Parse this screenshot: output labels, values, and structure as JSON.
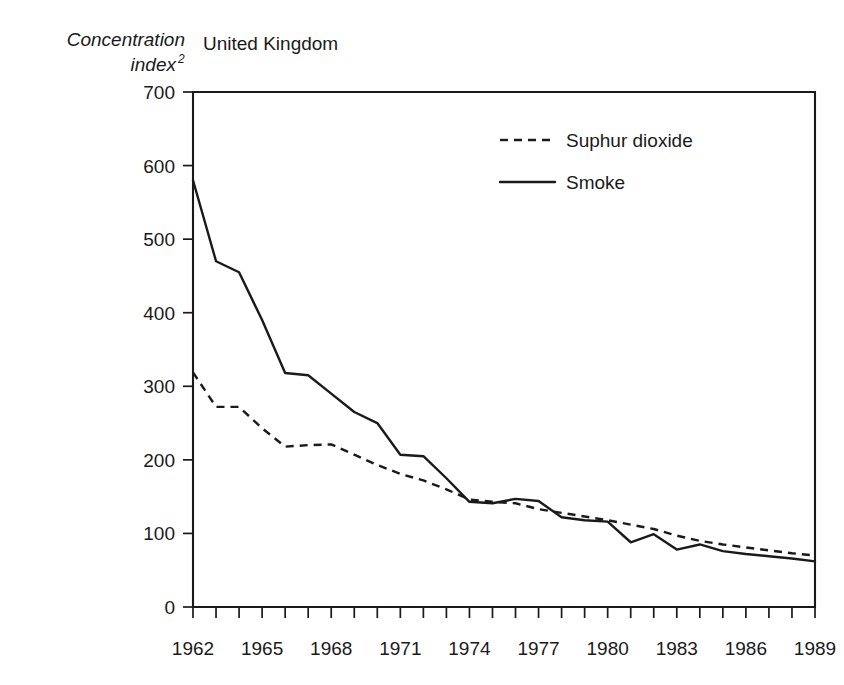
{
  "figure": {
    "panel_title": "United Kingdom",
    "y_axis_label_line1": "Concentration",
    "y_axis_label_line2": "index",
    "y_axis_label_superscript": "2"
  },
  "legend": {
    "position": "top-center-right",
    "entries": [
      {
        "label": "Suphur dioxide",
        "style": "dashed",
        "color": "#1a1a1a"
      },
      {
        "label": "Smoke",
        "style": "solid",
        "color": "#1a1a1a"
      }
    ]
  },
  "chart_data": {
    "type": "line",
    "title": "United Kingdom",
    "xlabel": "",
    "ylabel": "Concentration index2",
    "xlim": [
      1962,
      1989
    ],
    "ylim": [
      0,
      700
    ],
    "grid": false,
    "legend_position": "upper center",
    "x": [
      1962,
      1963,
      1964,
      1965,
      1966,
      1967,
      1968,
      1969,
      1970,
      1971,
      1972,
      1973,
      1974,
      1975,
      1976,
      1977,
      1978,
      1979,
      1980,
      1981,
      1982,
      1983,
      1984,
      1985,
      1986,
      1987,
      1988,
      1989
    ],
    "x_tick_labels": [
      "1962",
      "1965",
      "1968",
      "1971",
      "1974",
      "1977",
      "1980",
      "1983",
      "1986",
      "1989"
    ],
    "x_tick_values": [
      1962,
      1965,
      1968,
      1971,
      1974,
      1977,
      1980,
      1983,
      1986,
      1989
    ],
    "x_minor_ticks_every": 1,
    "y_tick_labels": [
      "0",
      "100",
      "200",
      "300",
      "400",
      "500",
      "600",
      "700"
    ],
    "y_tick_values": [
      0,
      100,
      200,
      300,
      400,
      500,
      600,
      700
    ],
    "series": [
      {
        "name": "Suphur dioxide",
        "style": "dashed",
        "color": "#1a1a1a",
        "values": [
          319,
          272,
          272,
          243,
          218,
          220,
          221,
          207,
          193,
          181,
          172,
          160,
          146,
          143,
          141,
          133,
          128,
          123,
          118,
          112,
          106,
          97,
          90,
          85,
          81,
          77,
          73,
          70
        ]
      },
      {
        "name": "Smoke",
        "style": "solid",
        "color": "#1a1a1a",
        "values": [
          580,
          470,
          455,
          390,
          318,
          315,
          290,
          265,
          250,
          207,
          205,
          175,
          143,
          141,
          147,
          144,
          122,
          118,
          116,
          88,
          99,
          78,
          85,
          76,
          72,
          69,
          66,
          62
        ]
      }
    ]
  }
}
